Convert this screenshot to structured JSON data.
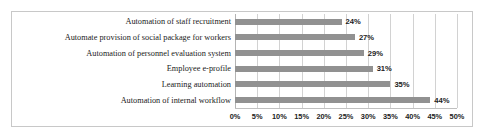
{
  "chart_data": {
    "type": "bar",
    "orientation": "horizontal",
    "title": "",
    "xlabel": "",
    "ylabel": "",
    "xlim": [
      0,
      50
    ],
    "grid": true,
    "legend": false,
    "bar_color": "#919191",
    "gridline_color": "#d2d2d2",
    "categories": [
      "Automation of staff recruitment",
      "Automate provision of social package for workers",
      "Automation of personnel evaluation system",
      "Employee e-profile",
      "Learning automation",
      "Automation of internal workflow"
    ],
    "values": [
      24,
      27,
      29,
      31,
      35,
      44
    ],
    "data_labels": [
      "24%",
      "27%",
      "29%",
      "31%",
      "35%",
      "44%"
    ],
    "xticks": [
      0,
      5,
      10,
      15,
      20,
      25,
      30,
      35,
      40,
      45,
      50
    ],
    "xtick_labels": [
      "0%",
      "5%",
      "10%",
      "15%",
      "20%",
      "25%",
      "30%",
      "35%",
      "40%",
      "45%",
      "50%"
    ]
  }
}
